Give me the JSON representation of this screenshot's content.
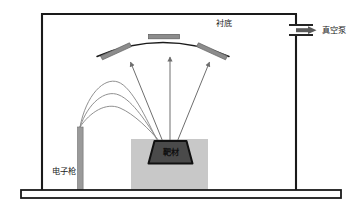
{
  "figure": {
    "kind": "schematic-diagram",
    "background_color": "#ffffff"
  },
  "labels": {
    "substrate": "衬底",
    "vacuum_pump": "真空泵",
    "electron_gun": "电子枪",
    "target": "靶材"
  },
  "colors": {
    "outline": "#1a1a1a",
    "chamber_wall": "#1a1a1a",
    "crucible_fill": "#c8c8c8",
    "target_fill": "#4a4a4a",
    "target_edge": "#111111",
    "substrate_plate_fill": "#8c8c8c",
    "gun_fill": "#9a9a9a",
    "beam_stroke": "#8a8a8a",
    "flux_arrow_stroke": "#6e6e6e",
    "pump_arrow_fill": "#5a5a5a",
    "base_plate_fill": "#ffffff"
  },
  "parts": {
    "chamber": {
      "name": "vacuum-chamber-wall"
    },
    "base_plate": {
      "name": "base-plate"
    },
    "dome": {
      "name": "substrate-holder-dome"
    },
    "substrate_plates": [
      {
        "name": "substrate-plate-left"
      },
      {
        "name": "substrate-plate-center"
      },
      {
        "name": "substrate-plate-right"
      }
    ],
    "electron_gun": {
      "name": "electron-gun-column"
    },
    "electron_beams": [
      {
        "name": "electron-beam-trajectory-1"
      },
      {
        "name": "electron-beam-trajectory-2"
      },
      {
        "name": "electron-beam-trajectory-3"
      }
    ],
    "vapor_flux": [
      {
        "name": "vapor-flux-arrow-left"
      },
      {
        "name": "vapor-flux-arrow-center"
      },
      {
        "name": "vapor-flux-arrow-right"
      }
    ],
    "crucible": {
      "name": "crucible-block"
    },
    "target": {
      "name": "target-trapezoid"
    },
    "pump_port": {
      "name": "vacuum-pump-port"
    },
    "pump_arrow": {
      "name": "vacuum-pump-flow-arrow"
    }
  }
}
